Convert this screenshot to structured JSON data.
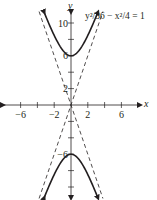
{
  "chart_data": {
    "type": "line",
    "title": "",
    "equation_label": "y²/36 − x²/4 = 1",
    "xlabel": "x",
    "ylabel": "y",
    "x_tick_labels": [
      "−6",
      "−2",
      "2",
      "6"
    ],
    "x_ticks": [
      -6,
      -4,
      -2,
      2,
      4,
      6
    ],
    "x_tick_labeled": [
      -6,
      -2,
      2,
      6
    ],
    "y_tick_labels": [
      "10",
      "6",
      "2",
      "−6"
    ],
    "y_ticks": [
      -12,
      -10,
      -8,
      -6,
      -4,
      -2,
      2,
      4,
      6,
      8,
      10,
      12
    ],
    "y_tick_labeled": [
      10,
      6,
      2,
      -6
    ],
    "xlim": [
      -8,
      8
    ],
    "ylim": [
      -11.5,
      11.5
    ],
    "grid": false,
    "legend": "none",
    "series": [
      {
        "name": "upper branch",
        "style": "solid",
        "arrows": true,
        "points": [
          [
            -3.2,
            11.32
          ],
          [
            -2,
            8.49
          ],
          [
            -1,
            6.71
          ],
          [
            0,
            6
          ],
          [
            1,
            6.71
          ],
          [
            2,
            8.49
          ],
          [
            3.2,
            11.32
          ]
        ]
      },
      {
        "name": "lower branch",
        "style": "solid",
        "arrows": true,
        "points": [
          [
            -3.2,
            -11.32
          ],
          [
            -2,
            -8.49
          ],
          [
            -1,
            -6.71
          ],
          [
            0,
            -6
          ],
          [
            1,
            -6.71
          ],
          [
            2,
            -8.49
          ],
          [
            3.2,
            -11.32
          ]
        ]
      },
      {
        "name": "asymptote y = 3x",
        "style": "dashed",
        "points": [
          [
            -3.8,
            -11.4
          ],
          [
            3.8,
            11.4
          ]
        ]
      },
      {
        "name": "asymptote y = -3x",
        "style": "dashed",
        "points": [
          [
            -3.8,
            11.4
          ],
          [
            3.8,
            -11.4
          ]
        ]
      }
    ],
    "vertices": [
      [
        0,
        6
      ],
      [
        0,
        -6
      ]
    ]
  }
}
